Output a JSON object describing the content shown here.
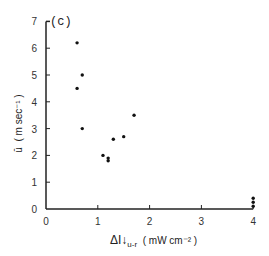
{
  "chart_data": {
    "type": "scatter",
    "title": "(c)",
    "xlabel": "ΔI↓ u-r ( mW cm⁻² )",
    "ylabel": "ū ( m sec⁻¹ )",
    "xlim": [
      0,
      4
    ],
    "ylim": [
      0,
      7
    ],
    "xticks": [
      0,
      1,
      2,
      3,
      4
    ],
    "yticks": [
      0,
      1,
      2,
      3,
      4,
      5,
      6,
      7
    ],
    "grid": false,
    "points": [
      {
        "x": 0.6,
        "y": 6.2
      },
      {
        "x": 0.7,
        "y": 5.0
      },
      {
        "x": 0.6,
        "y": 4.5
      },
      {
        "x": 0.7,
        "y": 3.0
      },
      {
        "x": 1.1,
        "y": 2.0
      },
      {
        "x": 1.2,
        "y": 1.9
      },
      {
        "x": 1.2,
        "y": 1.8
      },
      {
        "x": 1.3,
        "y": 2.6
      },
      {
        "x": 1.5,
        "y": 2.7
      },
      {
        "x": 1.7,
        "y": 3.5
      },
      {
        "x": 4.0,
        "y": 0.4
      },
      {
        "x": 4.0,
        "y": 0.25
      },
      {
        "x": 4.0,
        "y": 0.1
      }
    ]
  },
  "labels": {
    "panel": "(c)",
    "ylabel_main": "ū",
    "ylabel_units": "( m sec⁻¹ )",
    "xlabel_main": "ΔI↓",
    "xlabel_sub": "u-r",
    "xlabel_units": "( mW cm⁻² )"
  }
}
